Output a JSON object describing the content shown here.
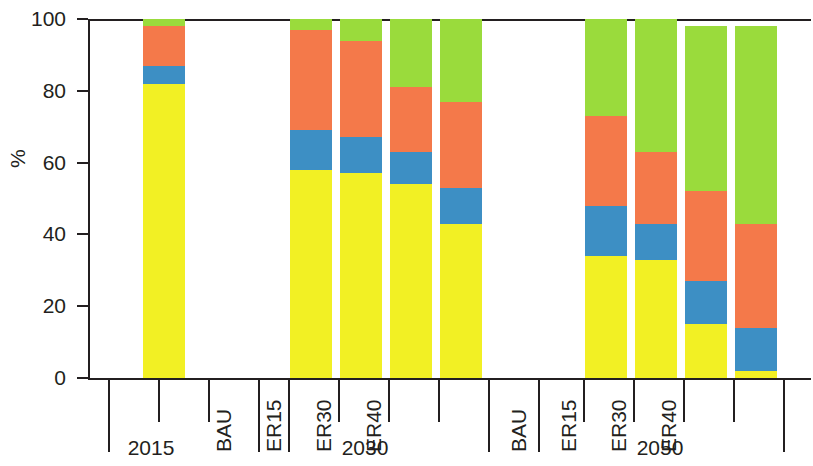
{
  "chart_data": {
    "type": "bar",
    "subtype": "stacked-bar-100",
    "title": "",
    "xlabel": "",
    "ylabel": "%",
    "ylim": [
      0,
      100
    ],
    "yticks": [
      0,
      20,
      40,
      60,
      80,
      100
    ],
    "ytick_labels": [
      "0",
      "20",
      "40",
      "60",
      "80",
      "100"
    ],
    "grid": false,
    "legend": "none",
    "colors": {
      "yellow": "#F2F024",
      "blue": "#3D8FC4",
      "orange": "#F4794A",
      "green": "#9ADB3C"
    },
    "series": [
      {
        "name": "yellow",
        "color": "#F2F024",
        "values": [
          82,
          58,
          57,
          54,
          43,
          34,
          33,
          15,
          2
        ]
      },
      {
        "name": "blue",
        "color": "#3D8FC4",
        "values": [
          5,
          11,
          10,
          9,
          10,
          14,
          10,
          12,
          12
        ]
      },
      {
        "name": "orange",
        "color": "#F4794A",
        "values": [
          11,
          28,
          27,
          18,
          24,
          25,
          20,
          25,
          29
        ]
      },
      {
        "name": "green",
        "color": "#9ADB3C",
        "values": [
          2,
          3,
          6,
          19,
          23,
          27,
          37,
          46,
          55
        ]
      }
    ],
    "groups": [
      {
        "label": "2015",
        "categories": [
          ""
        ]
      },
      {
        "label": "2030",
        "categories": [
          "BAU",
          "ER15",
          "ER30",
          "ER40"
        ]
      },
      {
        "label": "2050",
        "categories": [
          "BAU",
          "ER15",
          "ER30",
          "ER40"
        ]
      }
    ],
    "bars": [
      {
        "group": "2015",
        "category": "",
        "x": 53,
        "stack": {
          "yellow": 82,
          "blue": 5,
          "orange": 11,
          "green": 2
        },
        "tops": {
          "yellow": 82,
          "blue": 87,
          "orange": 98,
          "green": 100
        }
      },
      {
        "group": "2030",
        "category": "BAU",
        "x": 200,
        "stack": {
          "yellow": 58,
          "blue": 11,
          "orange": 28,
          "green": 3
        },
        "tops": {
          "yellow": 58,
          "blue": 69,
          "orange": 97,
          "green": 100
        }
      },
      {
        "group": "2030",
        "category": "ER15",
        "x": 250,
        "stack": {
          "yellow": 57,
          "blue": 10,
          "orange": 27,
          "green": 6
        },
        "tops": {
          "yellow": 57,
          "blue": 67,
          "orange": 94,
          "green": 100
        }
      },
      {
        "group": "2030",
        "category": "ER30",
        "x": 300,
        "stack": {
          "yellow": 54,
          "blue": 9,
          "orange": 18,
          "green": 19
        },
        "tops": {
          "yellow": 54,
          "blue": 63,
          "orange": 81,
          "green": 100
        }
      },
      {
        "group": "2030",
        "category": "ER40",
        "x": 350,
        "stack": {
          "yellow": 43,
          "blue": 10,
          "orange": 24,
          "green": 23
        },
        "tops": {
          "yellow": 43,
          "blue": 53,
          "orange": 77,
          "green": 100
        }
      },
      {
        "group": "2050",
        "category": "BAU",
        "x": 495,
        "stack": {
          "yellow": 34,
          "blue": 14,
          "orange": 25,
          "green": 27
        },
        "tops": {
          "yellow": 34,
          "blue": 48,
          "orange": 73,
          "green": 100
        }
      },
      {
        "group": "2050",
        "category": "ER15",
        "x": 545,
        "stack": {
          "yellow": 33,
          "blue": 10,
          "orange": 20,
          "green": 37
        },
        "tops": {
          "yellow": 33,
          "blue": 43,
          "orange": 63,
          "green": 100
        }
      },
      {
        "group": "2050",
        "category": "ER30",
        "x": 595,
        "stack": {
          "yellow": 15,
          "blue": 12,
          "orange": 25,
          "green": 46
        },
        "tops": {
          "yellow": 15,
          "blue": 27,
          "orange": 52,
          "green": 98
        }
      },
      {
        "group": "2050",
        "category": "ER40",
        "x": 645,
        "stack": {
          "yellow": 2,
          "blue": 12,
          "orange": 29,
          "green": 55
        },
        "tops": {
          "yellow": 2,
          "blue": 14,
          "orange": 43,
          "green": 98
        }
      }
    ]
  },
  "axis": {
    "y_label": "%",
    "ticks": [
      {
        "value": 100,
        "label": "100"
      },
      {
        "value": 80,
        "label": "80"
      },
      {
        "value": 60,
        "label": "60"
      },
      {
        "value": 40,
        "label": "40"
      },
      {
        "value": 20,
        "label": "20"
      },
      {
        "value": 0,
        "label": "0"
      }
    ]
  },
  "categories": {
    "g2015": {
      "label": "2015"
    },
    "g2030": {
      "label": "2030",
      "c0": "BAU",
      "c1": "ER15",
      "c2": "ER30",
      "c3": "ER40"
    },
    "g2050": {
      "label": "2050",
      "c0": "BAU",
      "c1": "ER15",
      "c2": "ER30",
      "c3": "ER40"
    }
  }
}
